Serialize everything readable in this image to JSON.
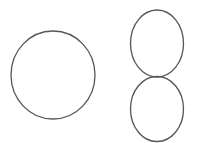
{
  "canvas": {
    "width": 200,
    "height": 143,
    "background": "#ffffff"
  },
  "style": {
    "stroke": "#555555",
    "stroke_width": 1.3,
    "fill": "none"
  },
  "shapes": [
    {
      "id": "left-circle",
      "type": "ellipse",
      "cx": 53,
      "cy": 75,
      "rx": 42,
      "ry": 44
    },
    {
      "id": "upper-right-ellipse",
      "type": "ellipse",
      "cx": 157,
      "cy": 43.5,
      "rx": 26.5,
      "ry": 33.5
    },
    {
      "id": "lower-right-ellipse",
      "type": "ellipse",
      "cx": 157,
      "cy": 109,
      "rx": 26.5,
      "ry": 32.5
    }
  ]
}
